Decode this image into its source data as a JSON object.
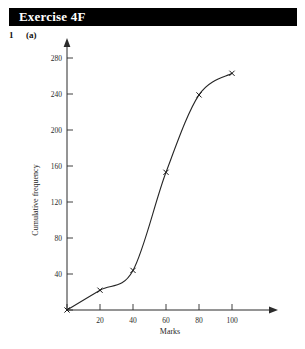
{
  "header": {
    "title": "Exercise 4F",
    "background_color": "#000000",
    "text_color": "#ffffff"
  },
  "question": {
    "number": "1",
    "part": "(a)"
  },
  "chart_data": {
    "type": "line",
    "title": "",
    "subtitle": "",
    "xlabel": "Marks",
    "ylabel": "Cumulative frequency",
    "xlim": [
      0,
      110
    ],
    "ylim": [
      0,
      290
    ],
    "xticks": [
      0,
      20,
      40,
      60,
      80,
      100
    ],
    "xtick_labels": [
      "",
      "20",
      "40",
      "60",
      "80",
      "100"
    ],
    "yticks": [
      0,
      40,
      80,
      120,
      160,
      200,
      240,
      280
    ],
    "ytick_labels": [
      "",
      "40",
      "80",
      "120",
      "160",
      "200",
      "240",
      "280"
    ],
    "grid": false,
    "legend": "none",
    "marker_style": "cross",
    "line_color": "#262626",
    "series": [
      {
        "name": "Cumulative frequency",
        "x": [
          0,
          20,
          40,
          60,
          80,
          100
        ],
        "values": [
          0,
          22,
          44,
          153,
          239,
          263
        ]
      }
    ],
    "annotations": []
  }
}
